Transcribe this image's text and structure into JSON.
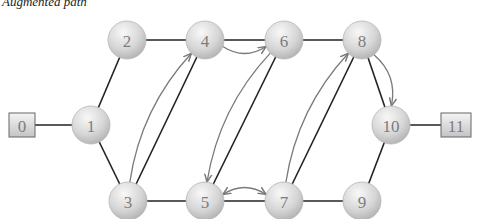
{
  "title": "Augmented path",
  "colors": {
    "edge": "#222222",
    "augmenting_path": "#7a7a7a",
    "node_fill_light": "#f4f4f4",
    "node_fill_dark": "#b8b8b8",
    "label": "#7d7d7d"
  },
  "nodes": [
    {
      "id": "0",
      "shape": "box",
      "x": 22,
      "y": 125
    },
    {
      "id": "1",
      "shape": "circle",
      "x": 91,
      "y": 125
    },
    {
      "id": "2",
      "shape": "circle",
      "x": 127,
      "y": 40
    },
    {
      "id": "3",
      "shape": "circle",
      "x": 128,
      "y": 201
    },
    {
      "id": "4",
      "shape": "circle",
      "x": 205,
      "y": 40
    },
    {
      "id": "5",
      "shape": "circle",
      "x": 205,
      "y": 201
    },
    {
      "id": "6",
      "shape": "circle",
      "x": 284,
      "y": 40
    },
    {
      "id": "7",
      "shape": "circle",
      "x": 284,
      "y": 201
    },
    {
      "id": "8",
      "shape": "circle",
      "x": 362,
      "y": 40
    },
    {
      "id": "9",
      "shape": "circle",
      "x": 362,
      "y": 201
    },
    {
      "id": "10",
      "shape": "circle",
      "x": 391,
      "y": 125
    },
    {
      "id": "11",
      "shape": "box",
      "x": 456,
      "y": 125
    }
  ],
  "edges": [
    [
      "0",
      "1"
    ],
    [
      "1",
      "2"
    ],
    [
      "1",
      "3"
    ],
    [
      "2",
      "4"
    ],
    [
      "3",
      "4"
    ],
    [
      "3",
      "5"
    ],
    [
      "4",
      "6"
    ],
    [
      "5",
      "6"
    ],
    [
      "6",
      "8"
    ],
    [
      "5",
      "7"
    ],
    [
      "7",
      "8"
    ],
    [
      "7",
      "9"
    ],
    [
      "8",
      "10"
    ],
    [
      "9",
      "10"
    ],
    [
      "10",
      "11"
    ]
  ],
  "augmenting_arrows": [
    {
      "from": "3",
      "to": "4"
    },
    {
      "from": "4",
      "to": "6"
    },
    {
      "from": "6",
      "to": "5"
    },
    {
      "from": "5",
      "to": "7",
      "bidirectional": true
    },
    {
      "from": "7",
      "to": "8"
    },
    {
      "from": "8",
      "to": "10"
    }
  ]
}
